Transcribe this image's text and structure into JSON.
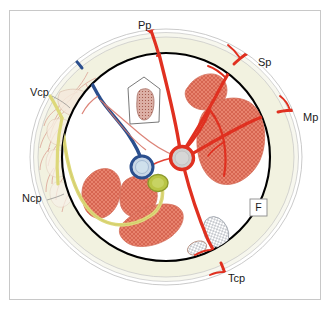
{
  "figure": {
    "frame": {
      "border_color": "#c8c8c8",
      "background": "#ffffff"
    }
  },
  "colors": {
    "outer_ring_fill": "#f2f2e2",
    "outer_ring_stroke": "#b9b9b9",
    "inner_circle_stroke": "#000000",
    "inner_circle_fill": "#ffffff",
    "artery_red": "#e03020",
    "vein_blue": "#2b4f8e",
    "nerve_yellow": "#ddd87a",
    "organ_salmon": "#e8836e",
    "organ_hatch": "#c9503c",
    "node_gray": "#cfcfcf",
    "olive_dot": "#b4c13c",
    "capillary_pink": "#d99a8e",
    "label_text": "#1a1a1a"
  },
  "labels": [
    {
      "id": "pp",
      "text": "Pp",
      "x": 138,
      "y": 26,
      "anchor": "start",
      "description": "posterior-superior vessel label"
    },
    {
      "id": "sp",
      "text": "Sp",
      "x": 258,
      "y": 63,
      "anchor": "start",
      "description": "superior-lateral vessel label"
    },
    {
      "id": "mp",
      "text": "Mp",
      "x": 303,
      "y": 118,
      "anchor": "start",
      "description": "mid-lateral vessel label"
    },
    {
      "id": "tcp",
      "text": "Tcp",
      "x": 228,
      "y": 279,
      "anchor": "start",
      "description": "inferior vessel label"
    },
    {
      "id": "ncp",
      "text": "Ncp",
      "x": 22,
      "y": 199,
      "anchor": "start",
      "description": "inferior-medial nerve label"
    },
    {
      "id": "vcp",
      "text": "Vcp",
      "x": 30,
      "y": 93,
      "anchor": "start",
      "description": "superior-medial vein label"
    }
  ],
  "boxed_label": {
    "id": "f-box",
    "text": "F",
    "x": 258,
    "y": 207,
    "width": 17,
    "height": 17,
    "border_color": "#8a8a8a",
    "fill": "#ffffff"
  },
  "geometry": {
    "center": {
      "x": 166,
      "y": 157
    },
    "outer_ring_outer_rx": 136,
    "outer_ring_outer_ry": 128,
    "outer_ring_inner_rx": 116,
    "outer_ring_inner_ry": 108,
    "inner_circle_r": 104
  },
  "structures": {
    "central_hub": {
      "name": "central vascular hub",
      "x": 182,
      "y": 158,
      "r": 11,
      "ring_color": "#e03020",
      "fill": "#cfcfcf"
    },
    "vein_terminal": {
      "name": "vein terminal bulb",
      "x": 142,
      "y": 167,
      "r": 11,
      "ring_color": "#2b4f8e",
      "fill": "#c9d6e4"
    },
    "olive_node": {
      "name": "olive node",
      "x": 158,
      "y": 183,
      "rx": 10,
      "ry": 8,
      "fill": "#b4c13c"
    },
    "trapezoid": {
      "name": "pentagonal outlined structure with stippled core",
      "outline_color": "#6a6a6a",
      "core_fill": "#d9a9a0"
    },
    "lymph_nodes": [
      {
        "name": "large hatched ellipse",
        "x": 216,
        "y": 232,
        "rx": 12,
        "ry": 16,
        "rotation": -25
      },
      {
        "name": "small hatched ellipse",
        "x": 198,
        "y": 247,
        "rx": 9,
        "ry": 6,
        "rotation": -20
      }
    ],
    "organs": [
      {
        "name": "upper-right small lobe"
      },
      {
        "name": "right large lobe"
      },
      {
        "name": "left upper lobe"
      },
      {
        "name": "left mid lobe"
      },
      {
        "name": "lower-central lobe"
      }
    ]
  }
}
